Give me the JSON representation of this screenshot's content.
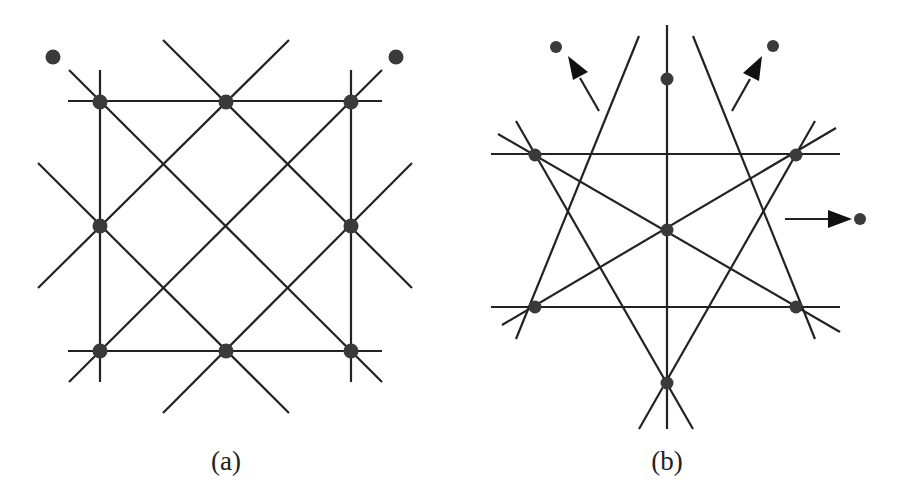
{
  "figure": {
    "panels": [
      {
        "id": "a",
        "caption": "(a)",
        "description": "Square grid of intersecting horizontal, vertical and diagonal lines with 8 nodes; two isolated points outside top corners",
        "nodes": [
          [
            100,
            102
          ],
          [
            226,
            102
          ],
          [
            351,
            102
          ],
          [
            100,
            226
          ],
          [
            351,
            226
          ],
          [
            100,
            351
          ],
          [
            226,
            351
          ],
          [
            351,
            351
          ]
        ],
        "free_points": [
          [
            52,
            56
          ],
          [
            397,
            56
          ]
        ]
      },
      {
        "id": "b",
        "caption": "(b)",
        "description": "Hexagram-like arrangement of lines with 7 nodes; three points pushed outward with arrows",
        "nodes": [
          [
            667,
            79
          ],
          [
            535,
            155
          ],
          [
            796,
            155
          ],
          [
            667,
            230
          ],
          [
            535,
            307
          ],
          [
            796,
            307
          ],
          [
            667,
            383
          ]
        ],
        "free_points": [
          [
            555,
            46
          ],
          [
            772,
            46
          ],
          [
            860,
            219
          ]
        ],
        "arrows": 3
      }
    ]
  },
  "colors": {
    "line": "#222222",
    "node": "#3a3a3a",
    "background": "#ffffff"
  }
}
